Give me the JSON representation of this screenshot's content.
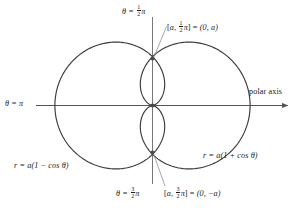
{
  "figure": {
    "axes": {
      "polar_axis_label": "polar axis",
      "theta_pi_label": "θ = π",
      "theta_half_pi_label_prefix": "θ = ",
      "theta_half_pi_numerator": "1",
      "theta_half_pi_denominator": "2",
      "theta_half_pi_suffix": "π",
      "theta_three_half_pi_prefix": "θ = ",
      "theta_three_half_pi_numerator": "3",
      "theta_three_half_pi_denominator": "2",
      "theta_three_half_pi_suffix": "π"
    },
    "points": {
      "upper": {
        "bracket_open": "[",
        "radius": "a",
        "comma": ", ",
        "numerator": "1",
        "denominator": "2",
        "angle_suffix": "π",
        "bracket_close": "]",
        "equals": " = ",
        "cartesian": "(0, a)"
      },
      "lower": {
        "bracket_open": "[",
        "radius": "a",
        "comma": ", ",
        "numerator": "3",
        "denominator": "2",
        "angle_suffix": "π",
        "bracket_close": "]",
        "equals": " = ",
        "cartesian": "(0, −a)"
      }
    },
    "equations": {
      "left_curve": "r = a(1 − cos θ)",
      "left_curve_r": "r",
      "left_curve_rest": " = a(1 − cos θ)",
      "right_curve_r": "r",
      "right_curve_rest": " = a(1 + cos θ)"
    },
    "colors": {
      "curve": "#3a3a3a",
      "axis": "#555555",
      "leader": "#8a8a8a",
      "text": "#1a1a1a",
      "background": "#ffffff"
    }
  },
  "chart_data": {
    "type": "line",
    "xlabel": "polar axis",
    "ylabel": "",
    "grid": false,
    "legend": "none",
    "series": [
      {
        "name": "r = a(1 + cos θ)",
        "equation": "r = a(1 + cos theta)",
        "cusp_at": "origin",
        "extends": "right",
        "max_r": "2a at θ = 0"
      },
      {
        "name": "r = a(1 − cos θ)",
        "equation": "r = a(1 - cos theta)",
        "cusp_at": "origin",
        "extends": "left",
        "max_r": "2a at θ = π"
      }
    ],
    "annotations": [
      {
        "label": "[a, 1/2 π] = (0, a)",
        "at": "intersection upper"
      },
      {
        "label": "[a, 3/2 π] = (0, −a)",
        "at": "intersection lower"
      },
      {
        "label": "θ = π",
        "at": "negative polar axis"
      },
      {
        "label": "θ = 1/2 π",
        "at": "positive vertical axis"
      },
      {
        "label": "θ = 3/2 π",
        "at": "negative vertical axis"
      },
      {
        "label": "polar axis",
        "at": "positive horizontal axis"
      }
    ]
  }
}
